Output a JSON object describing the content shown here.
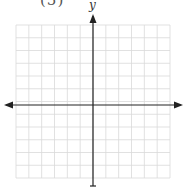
{
  "problem": {
    "label": "(5)"
  },
  "axes": {
    "y_label": "y",
    "x_label": ""
  },
  "grid": {
    "left": 16,
    "right": 170,
    "top": 25,
    "bottom": 178,
    "columns": 12,
    "rows": 12,
    "line_color": "#d9d9d9",
    "axis_color": "#222222",
    "origin_x": 93,
    "origin_y": 105
  }
}
